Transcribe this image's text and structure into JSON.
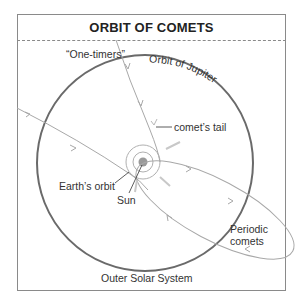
{
  "title": "ORBIT OF COMETS",
  "labels": {
    "one_timers": "“One-timers”",
    "orbit_of_jupiter": "Orbit of Jupiter",
    "comets_tail": "comet’s tail",
    "earths_orbit": "Earth’s orbit",
    "sun": "Sun",
    "periodic_comets_line1": "Periodic",
    "periodic_comets_line2": "comets",
    "outer_solar_system": "Outer Solar System"
  },
  "colors": {
    "jupiter_orbit": "#6a6a6a",
    "comet_paths": "#a8a8a8",
    "sun": "#9a9a9a",
    "frame": "#8a8a8a",
    "text": "#333333"
  }
}
